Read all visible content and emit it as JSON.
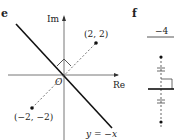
{
  "panels": [
    {
      "label": "e",
      "axes": {
        "x_label": "Re",
        "y_label": "Im",
        "origin_label": "O"
      },
      "points": [
        {
          "label": "(2, 2)",
          "x": 2,
          "y": 2
        },
        {
          "label": "(−2, −2)",
          "x": -2,
          "y": -2
        }
      ],
      "line_label": "y = −x"
    },
    {
      "label": "f",
      "top_label": "−4"
    }
  ]
}
